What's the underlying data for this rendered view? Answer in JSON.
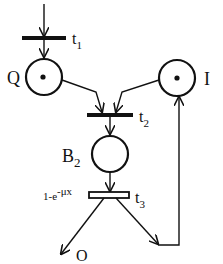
{
  "diagram": {
    "type": "petri-net",
    "colors": {
      "stroke": "#111111",
      "background": "#ffffff"
    },
    "places": [
      {
        "id": "Q",
        "label": "Q",
        "tokens": 1
      },
      {
        "id": "I",
        "label": "I",
        "tokens": 1
      },
      {
        "id": "B2",
        "label": "B",
        "subscript": "2",
        "tokens": 0
      }
    ],
    "transitions": [
      {
        "id": "t1",
        "label": "t",
        "subscript": "1",
        "kind": "immediate"
      },
      {
        "id": "t2",
        "label": "t",
        "subscript": "2",
        "kind": "immediate"
      },
      {
        "id": "t3",
        "label": "t",
        "subscript": "3",
        "kind": "timed",
        "rate_label": "1-e",
        "rate_exponent": "-μx"
      }
    ],
    "outputs": [
      {
        "id": "O",
        "label": "O"
      }
    ],
    "arcs": [
      {
        "from": "source",
        "to": "t1"
      },
      {
        "from": "t1",
        "to": "Q"
      },
      {
        "from": "Q",
        "to": "t2"
      },
      {
        "from": "I",
        "to": "t2"
      },
      {
        "from": "t2",
        "to": "B2"
      },
      {
        "from": "B2",
        "to": "t3"
      },
      {
        "from": "t3",
        "to": "O"
      },
      {
        "from": "t3",
        "to": "I"
      }
    ]
  }
}
